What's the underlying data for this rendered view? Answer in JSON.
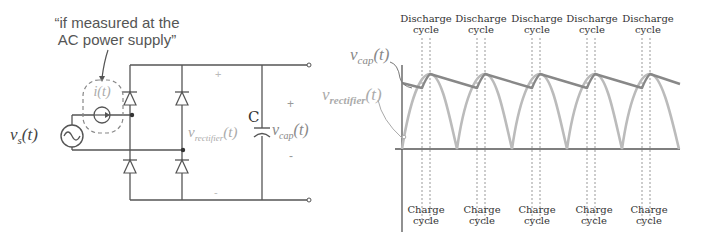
{
  "annotation": {
    "line1": "“if measured at the",
    "line2": "AC power supply”"
  },
  "circuit": {
    "source_label": {
      "main": "v",
      "sub": "s",
      "arg": "(t)"
    },
    "current_label": "i(t)",
    "capacitor_label": "C",
    "rectifier_voltage_label": {
      "main": "v",
      "sub": "rectifier",
      "arg": "(t)"
    },
    "cap_voltage_label": {
      "main": "v",
      "sub": "cap",
      "arg": "(t)"
    },
    "plus_sign": "+",
    "minus_sign": "-",
    "colors": {
      "wire": "#555555",
      "faded": "#aaaaaa",
      "dashed": "#888888"
    }
  },
  "graph": {
    "vcap_label": {
      "main": "v",
      "sub": "cap",
      "arg": "(t)"
    },
    "vrect_label": {
      "main": "v",
      "sub": "rectifier",
      "arg": "(t)"
    },
    "discharge_labels": [
      {
        "line1": "Discharge",
        "line2": "cycle"
      },
      {
        "line1": "Discharge",
        "line2": "cycle"
      },
      {
        "line1": "Discharge",
        "line2": "cycle"
      },
      {
        "line1": "Discharge",
        "line2": "cycle"
      },
      {
        "line1": "Discharge",
        "line2": "cycle"
      }
    ],
    "charge_labels": [
      {
        "line1": "Charge",
        "line2": "cycle"
      },
      {
        "line1": "Charge",
        "line2": "cycle"
      },
      {
        "line1": "Charge",
        "line2": "cycle"
      },
      {
        "line1": "Charge",
        "line2": "cycle"
      },
      {
        "line1": "Charge",
        "line2": "cycle"
      }
    ],
    "colors": {
      "vcap": "#888888",
      "vrect": "#bbbbbb",
      "axis": "#555555",
      "dotted": "#999999"
    }
  }
}
